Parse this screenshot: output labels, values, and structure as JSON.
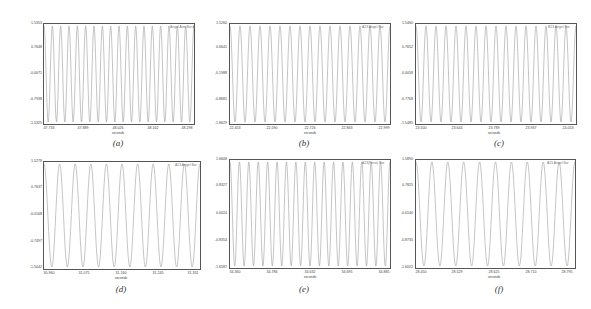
{
  "chart_data": [
    {
      "id": "a",
      "type": "line",
      "caption": "(a)",
      "legend": "Angel Arm Bar A",
      "xlabel": "seconds",
      "ylabel": "",
      "x_ticks": [
        "47.733",
        "47.889",
        "48.026",
        "48.162",
        "48.298"
      ],
      "y_ticks": [
        "1.5353",
        "0.7648",
        "-0.0071",
        "-0.7938",
        "-1.5325"
      ],
      "ylim": [
        -1.5325,
        1.5353
      ],
      "cycles": 18,
      "series": [
        {
          "name": "signal",
          "waveform": "sinusoid",
          "amplitude": 1.53
        }
      ]
    },
    {
      "id": "b",
      "type": "line",
      "caption": "(b)",
      "legend": "A23 Angel Bar",
      "xlabel": "seconds",
      "ylabel": "",
      "x_ticks": [
        "22.453",
        "22.590",
        "22.726",
        "22.863",
        "22.999"
      ],
      "y_ticks": [
        "1.5260",
        "0.6641",
        "-0.1988",
        "-0.8681",
        "-1.8629"
      ],
      "ylim": [
        -1.8629,
        1.526
      ],
      "cycles": 16,
      "series": [
        {
          "name": "signal",
          "waveform": "sinusoid",
          "amplitude": 1.5
        }
      ]
    },
    {
      "id": "c",
      "type": "line",
      "caption": "(c)",
      "legend": "B23 Angel Bar",
      "xlabel": "seconds",
      "ylabel": "",
      "x_ticks": [
        "23.500",
        "23.644",
        "23.789",
        "23.937",
        "24.053"
      ],
      "y_ticks": [
        "1.5460",
        "0.7652",
        "-0.0058",
        "-0.7768",
        "-1.5485"
      ],
      "ylim": [
        -1.5485,
        1.546
      ],
      "cycles": 16,
      "series": [
        {
          "name": "signal",
          "waveform": "sinusoid",
          "amplitude": 1.54
        }
      ]
    },
    {
      "id": "d",
      "type": "line",
      "caption": "(d)",
      "legend": "A23 Angel Bar",
      "xlabel": "seconds",
      "ylabel": "",
      "x_ticks": [
        "30.960",
        "31.075",
        "31.160",
        "31.245",
        "31.331"
      ],
      "y_ticks": [
        "1.5278",
        "0.7637",
        "-0.0168",
        "-0.7497",
        "-1.5042"
      ],
      "ylim": [
        -1.5042,
        1.5278
      ],
      "cycles": 10,
      "series": [
        {
          "name": "signal",
          "waveform": "sinusoid",
          "amplitude": 1.5
        }
      ]
    },
    {
      "id": "e",
      "type": "line",
      "caption": "(e)",
      "legend": "A23(Reso) Bar",
      "xlabel": "seconds",
      "ylabel": "",
      "x_ticks": [
        "34.360",
        "34.786",
        "34.632",
        "34.695",
        "34.885"
      ],
      "y_ticks": [
        "1.6608",
        "0.8327",
        "0.0024",
        "-0.8354",
        "-1.6587"
      ],
      "ylim": [
        -1.6587,
        1.6608
      ],
      "cycles": 17,
      "series": [
        {
          "name": "signal",
          "waveform": "sinusoid",
          "amplitude": 1.5
        }
      ]
    },
    {
      "id": "f",
      "type": "line",
      "caption": "(f)",
      "legend": "A25 Angel Bar",
      "xlabel": "seconds",
      "ylabel": "",
      "x_ticks": [
        "28.450",
        "28.529",
        "28.625",
        "28.710",
        "28.795"
      ],
      "y_ticks": [
        "1.5890",
        "0.7825",
        "-0.0140",
        "-0.8735",
        "-1.6022"
      ],
      "ylim": [
        -1.6022,
        1.589
      ],
      "cycles": 10,
      "series": [
        {
          "name": "signal",
          "waveform": "sinusoid",
          "amplitude": 1.58
        }
      ]
    }
  ],
  "colors": {
    "line": "#8a8a8a",
    "frame": "#555555",
    "text": "#444444"
  }
}
